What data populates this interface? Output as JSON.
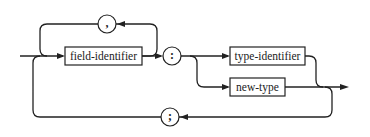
{
  "diagram": {
    "type": "syntax-diagram",
    "nodes": {
      "field_identifier": "field-identifier",
      "type_identifier": "type-identifier",
      "new_type": "new-type",
      "comma": ",",
      "colon": ":",
      "semicolon": ";"
    },
    "colors": {
      "line": "#222222",
      "background": "#ffffff"
    }
  }
}
